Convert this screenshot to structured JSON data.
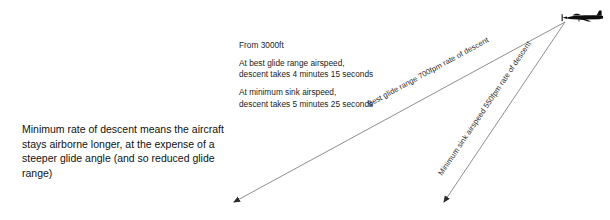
{
  "diagram": {
    "left_note": "Minimum rate of descent means the aircraft\nstays airborne longer, at the expense of a\nsteeper glide angle (and so reduced glide range)",
    "altitude_note": {
      "heading": "From 3000ft",
      "cases": [
        {
          "line1": "At best glide range airspeed,",
          "line2": "descent takes 4 minutes 15 seconds"
        },
        {
          "line1": "At minimum sink airspeed,",
          "line2": "descent takes 5 minutes 25 seconds"
        }
      ]
    },
    "paths": [
      {
        "label": "Best glide range 700fpm rate of descent",
        "kind": "best-glide-range"
      },
      {
        "label": "Minimum sink airspeed 550fpm rate of descent",
        "kind": "minimum-sink"
      }
    ],
    "aircraft": {
      "icon": "airplane-side-icon"
    },
    "colors": {
      "line": "#6e6e6e",
      "text": "#1a1a1a",
      "aircraft": "#0d0d0d",
      "background": "#ffffff"
    }
  }
}
